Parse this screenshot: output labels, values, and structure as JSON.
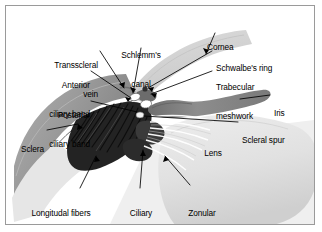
{
  "figure": {
    "title_visible": false,
    "border_color": "#9a9a9a",
    "background": "#ffffff"
  },
  "palette": {
    "sclera_gray": "#9d9d9d",
    "sclera_dark_edge": "#6f6f6f",
    "ciliary_muscle_dark": "#1c1c1c",
    "iris_gray": "#8a8a8a",
    "cornea_light": "#d6d6d6",
    "lens_light": "#e4e4e4",
    "canal_white": "#ffffff",
    "leader_line": "#000000",
    "text": "#000000"
  },
  "labels": [
    {
      "id": "cornea",
      "text": "Cornea",
      "align": "left"
    },
    {
      "id": "schlemms-canal",
      "text": "Schlemm's\ncanal",
      "align": "center"
    },
    {
      "id": "transscleral-vein",
      "text": "Transscleral\nvein",
      "align": "right"
    },
    {
      "id": "schwalbes-ring",
      "text": "Schwalbe's ring",
      "align": "left"
    },
    {
      "id": "anterior-ciliary-band",
      "text": "Anterior\nciliary band",
      "align": "right"
    },
    {
      "id": "trabecular-meshwork",
      "text": "Trabecular\nmeshwork",
      "align": "left"
    },
    {
      "id": "posterior-ciliary-band",
      "text": "Posterior\nciliary band",
      "align": "right"
    },
    {
      "id": "iris",
      "text": "Iris",
      "align": "left"
    },
    {
      "id": "scleral-spur",
      "text": "Scleral spur",
      "align": "left"
    },
    {
      "id": "sclera",
      "text": "Sclera",
      "align": "right"
    },
    {
      "id": "lens",
      "text": "Lens",
      "align": "center"
    },
    {
      "id": "longitudal-fibers",
      "text": "Longitudal fibers\nof ciliary muscle",
      "align": "center"
    },
    {
      "id": "ciliary-processes",
      "text": "Ciliary\nprocesses",
      "align": "center"
    },
    {
      "id": "zonular-fibers",
      "text": "Zonular\nfibers",
      "align": "center"
    }
  ],
  "label_text": {
    "cornea": "Cornea",
    "schlemms_canal_l1": "Schlemm's",
    "schlemms_canal_l2": "canal",
    "transscleral_l1": "Transscleral",
    "transscleral_l2": "vein",
    "schwalbes_ring": "Schwalbe's ring",
    "anterior_l1": "Anterior",
    "anterior_l2": "ciliary band",
    "trabecular_l1": "Trabecular",
    "trabecular_l2": "meshwork",
    "posterior_l1": "Posterior",
    "posterior_l2": "ciliary band",
    "iris": "Iris",
    "scleral_spur": "Scleral spur",
    "sclera": "Sclera",
    "lens": "Lens",
    "longitudal_l1": "Longitudal fibers",
    "longitudal_l2": "of ciliary muscle",
    "ciliary_proc_l1": "Ciliary",
    "ciliary_proc_l2": "processes",
    "zonular_l1": "Zonular",
    "zonular_l2": "fibers"
  },
  "structures": [
    {
      "id": "cornea",
      "name": "cornea",
      "shade": "light-gray"
    },
    {
      "id": "sclera",
      "name": "sclera",
      "shade": "mid-gray"
    },
    {
      "id": "ciliary-muscle",
      "name": "longitudinal ciliary muscle fibers",
      "shade": "near-black"
    },
    {
      "id": "iris",
      "name": "iris",
      "shade": "mid-gray"
    },
    {
      "id": "lens",
      "name": "lens",
      "shade": "very-light-gray"
    },
    {
      "id": "schlemms-canal",
      "name": "Schlemm's canal lumen",
      "shade": "white"
    },
    {
      "id": "zonular-fibers",
      "name": "zonular fibers",
      "shade": "white-streaks"
    },
    {
      "id": "ciliary-processes",
      "name": "ciliary processes",
      "shade": "dark-gray"
    }
  ]
}
